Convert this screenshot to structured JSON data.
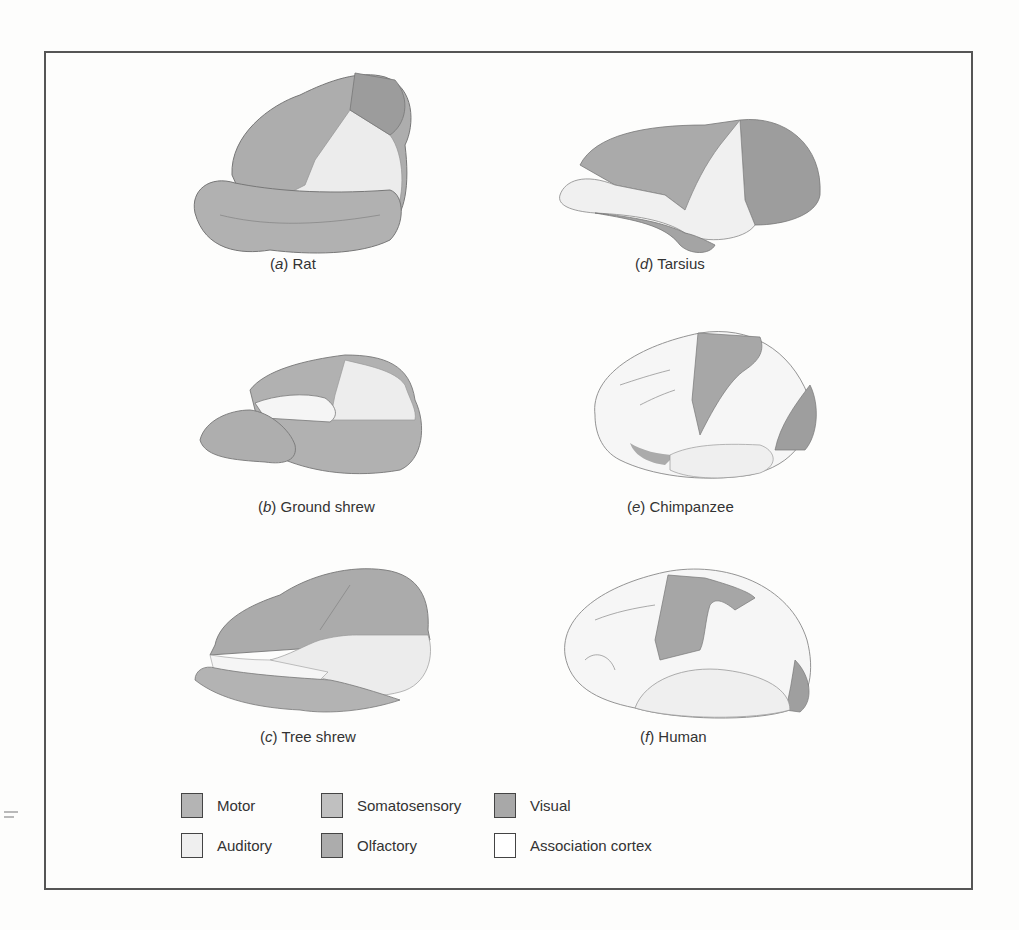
{
  "figure": {
    "panels": [
      {
        "letter": "a",
        "name": "Rat"
      },
      {
        "letter": "b",
        "name": "Ground shrew"
      },
      {
        "letter": "c",
        "name": "Tree shrew"
      },
      {
        "letter": "d",
        "name": "Tarsius"
      },
      {
        "letter": "e",
        "name": "Chimpanzee"
      },
      {
        "letter": "f",
        "name": "Human"
      }
    ],
    "legend": [
      {
        "label": "Motor",
        "color": "#b4b4b4"
      },
      {
        "label": "Somatosensory",
        "color": "#c2c2c2"
      },
      {
        "label": "Visual",
        "color": "#a6a6a6"
      },
      {
        "label": "Auditory",
        "color": "#eeeeee"
      },
      {
        "label": "Olfactory",
        "color": "#acacac"
      },
      {
        "label": "Association cortex",
        "color": "#ffffff"
      }
    ]
  },
  "colors": {
    "frame": "#555555",
    "motor": "#a9a9a9",
    "somatosensory": "#bdbdbd",
    "visual": "#9f9f9f",
    "auditory": "#ececec",
    "olfactory": "#b3b3b3",
    "association": "#f7f7f7"
  }
}
